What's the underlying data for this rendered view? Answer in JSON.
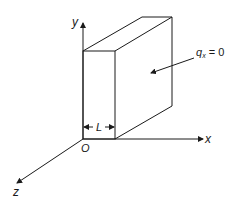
{
  "diagram": {
    "axes": {
      "x_label": "x",
      "y_label": "y",
      "z_label": "z",
      "origin_label": "O"
    },
    "dimension": {
      "label": "L"
    },
    "boundary_condition": {
      "symbol": "q",
      "subscript": "x",
      "equals": " = 0"
    },
    "colors": {
      "stroke": "#1a1a1a",
      "background": "#ffffff"
    }
  }
}
